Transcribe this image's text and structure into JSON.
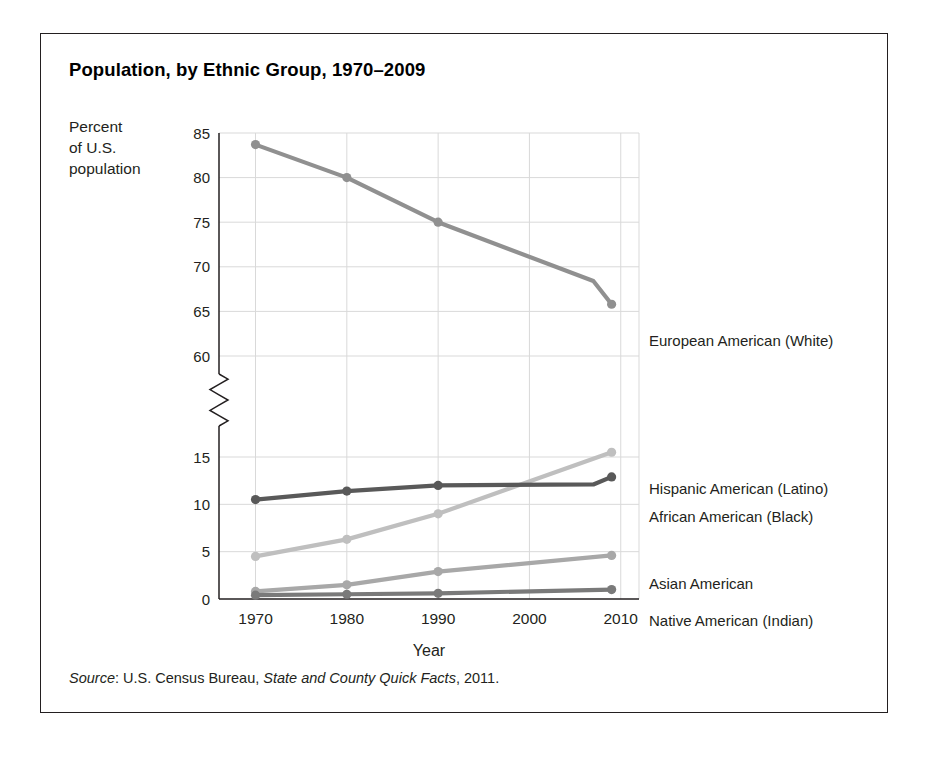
{
  "figure": {
    "title": "Population, by Ethnic Group, 1970–2009",
    "y_axis_title_lines": [
      "Percent",
      "of U.S.",
      "population"
    ],
    "source": {
      "label": "Source",
      "separator": ": ",
      "publisher": "U.S. Census Bureau, ",
      "work": "State and County Quick Facts",
      "year": ", 2011."
    }
  },
  "chart_data": {
    "type": "line",
    "title": "Population, by Ethnic Group, 1970–2009",
    "xlabel": "Year",
    "ylabel": "Percent of U.S. population",
    "x": [
      1970,
      1980,
      1990,
      2009
    ],
    "xlim": [
      1966,
      2012
    ],
    "xticks": [
      1970,
      1980,
      1990,
      2000,
      2010
    ],
    "xticklabels": [
      "1970",
      "1980",
      "1990",
      "2000",
      "2010"
    ],
    "y_axis_broken": true,
    "y_lower_range": [
      0,
      15
    ],
    "y_upper_range": [
      60,
      85
    ],
    "yticks_lower": [
      0,
      5,
      10,
      15
    ],
    "yticks_upper": [
      60,
      65,
      70,
      75,
      80,
      85
    ],
    "yticklabels": [
      "0",
      "5",
      "10",
      "15",
      "60",
      "65",
      "70",
      "75",
      "80",
      "85"
    ],
    "grid": true,
    "legend_position": "right-inline",
    "series": [
      {
        "name": "European American (White)",
        "color": "#909090",
        "x": [
          1970,
          1980,
          1990,
          2007,
          2009
        ],
        "values": [
          83.7,
          80.0,
          75.0,
          68.4,
          65.8
        ],
        "markers_at": [
          1970,
          1980,
          1990,
          2009
        ]
      },
      {
        "name": "Hispanic American (Latino)",
        "color": "#bfbfbf",
        "x": [
          1970,
          1980,
          1990,
          2009
        ],
        "values": [
          4.5,
          6.3,
          9.0,
          15.5
        ],
        "markers_at": [
          1970,
          1980,
          1990,
          2009
        ]
      },
      {
        "name": "African American (Black)",
        "color": "#595959",
        "x": [
          1970,
          1980,
          1990,
          2007,
          2009
        ],
        "values": [
          10.5,
          11.4,
          12.0,
          12.1,
          12.9
        ],
        "markers_at": [
          1970,
          1980,
          1990,
          2009
        ]
      },
      {
        "name": "Asian American",
        "color": "#a8a8a8",
        "x": [
          1970,
          1980,
          1990,
          2009
        ],
        "values": [
          0.8,
          1.5,
          2.9,
          4.6
        ],
        "markers_at": [
          1970,
          1980,
          1990,
          2009
        ]
      },
      {
        "name": "Native American (Indian)",
        "color": "#7a7a7a",
        "x": [
          1970,
          1980,
          1990,
          2009
        ],
        "values": [
          0.4,
          0.5,
          0.6,
          1.0
        ],
        "markers_at": [
          1970,
          1980,
          1990,
          2009
        ]
      }
    ]
  },
  "series_labels": [
    {
      "text": "European American (White)",
      "top": 298
    },
    {
      "text": "Hispanic American (Latino)",
      "top": 446
    },
    {
      "text": "African American (Black)",
      "top": 474
    },
    {
      "text": "Asian American",
      "top": 541
    },
    {
      "text": "Native American (Indian)",
      "top": 578
    }
  ],
  "axis": {
    "x_title": "Year",
    "colors": {
      "grid": "#d9d9d9",
      "axis": "#231f20",
      "tick_text": "#231f20"
    }
  }
}
